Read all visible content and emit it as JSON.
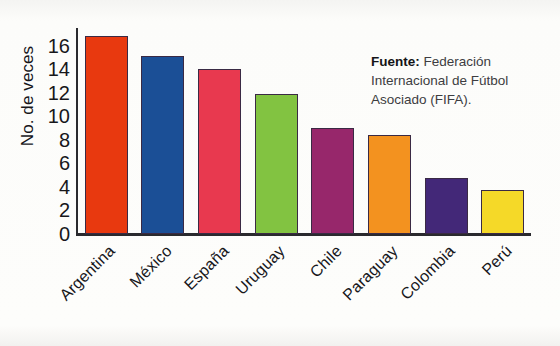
{
  "chart_data": {
    "type": "bar",
    "title": "",
    "xlabel": "",
    "ylabel": "No. de veces",
    "categories": [
      "Argentina",
      "México",
      "España",
      "Uruguay",
      "Chile",
      "Paraguay",
      "Colombia",
      "Perú"
    ],
    "values": [
      16.8,
      15.1,
      14.0,
      11.9,
      9.0,
      8.4,
      4.8,
      3.7
    ],
    "colors": [
      "#E8390F",
      "#1B4F96",
      "#E8394F",
      "#82C341",
      "#97276B",
      "#F3921F",
      "#432878",
      "#F5D928"
    ],
    "ylim": [
      0,
      17.5
    ],
    "yticks": [
      0,
      2,
      4,
      6,
      8,
      10,
      12,
      14,
      16
    ],
    "ytick_labels": [
      "0",
      "2",
      "4",
      "6",
      "8",
      "10",
      "12",
      "14",
      "16"
    ],
    "grid": false,
    "legend": null,
    "annotations": [
      {
        "name": "source-note",
        "label": "Fuente:",
        "text": "Federación Internacional de Fútbol Asociado (FIFA)."
      }
    ]
  },
  "source_note": {
    "label": "Fuente:",
    "text": " Federación Internacional de Fútbol Asociado (FIFA)."
  }
}
